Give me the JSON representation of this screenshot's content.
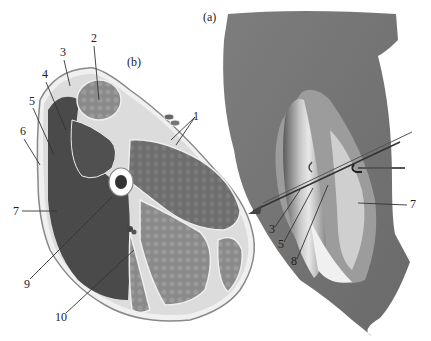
{
  "figure": {
    "panel_a_label": "(a)",
    "panel_b_label": "(b)",
    "panel_b": {
      "description": "cross-section of thigh",
      "labels": [
        {
          "id": "1",
          "text": "1",
          "x": 193,
          "y": 112
        },
        {
          "id": "2",
          "text": "2",
          "x": 91,
          "y": 40
        },
        {
          "id": "3",
          "text": "3",
          "x": 60,
          "y": 54
        },
        {
          "id": "4",
          "text": "4",
          "x": 42,
          "y": 76
        },
        {
          "id": "5",
          "text": "5",
          "x": 29,
          "y": 103
        },
        {
          "id": "6",
          "text": "6",
          "x": 20,
          "y": 133
        },
        {
          "id": "7",
          "text": "7",
          "x": 13,
          "y": 209
        },
        {
          "id": "9",
          "text": "9",
          "x": 24,
          "y": 284
        },
        {
          "id": "10",
          "text": "10",
          "x": 55,
          "y": 318
        }
      ]
    },
    "panel_a": {
      "description": "surgical exposure view of thigh",
      "labels": [
        {
          "id": "3",
          "text": "3",
          "x": 269,
          "y": 230
        },
        {
          "id": "5",
          "text": "5",
          "x": 278,
          "y": 245
        },
        {
          "id": "8",
          "text": "8",
          "x": 291,
          "y": 262
        },
        {
          "id": "7",
          "text": "7",
          "x": 412,
          "y": 204
        }
      ]
    },
    "colors": {
      "dark_muscle": "#4a4a4a",
      "mid_muscle": "#7a7a7a",
      "light_muscle": "#8e8e8e",
      "fascia": "#f2f2f2",
      "skin_outline": "#9a9a9a",
      "background": "#ffffff"
    }
  }
}
